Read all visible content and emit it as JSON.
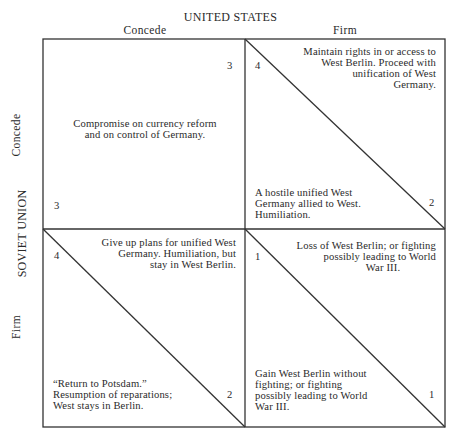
{
  "header": {
    "column_player": "UNITED STATES",
    "column_strategies": [
      "Concede",
      "Firm"
    ]
  },
  "side": {
    "row_player": "SOVIET UNION",
    "row_strategies": [
      "Concede",
      "Firm"
    ]
  },
  "cells": {
    "concede_concede": {
      "text": "Compromise on currency reform and on control of Germany.",
      "lines": [
        "Compromise on currency reform",
        "and on control of Germany."
      ],
      "us_payoff": "3",
      "su_payoff": "3"
    },
    "su_concede_us_firm": {
      "us_lines": [
        "Maintain rights in or access to",
        "West Berlin. Proceed with",
        "unification of West",
        "Germany."
      ],
      "su_lines": [
        "A hostile unified West",
        "Germany allied to West.",
        "Humiliation."
      ],
      "us_payoff": "4",
      "su_payoff": "2"
    },
    "su_firm_us_concede": {
      "us_lines": [
        "Give up plans for unified West",
        "Germany. Humiliation, but",
        "stay in West Berlin."
      ],
      "su_lines": [
        "“Return to Potsdam.”",
        "Resumption of reparations;",
        "West stays in Berlin."
      ],
      "us_payoff": "2",
      "su_payoff": "4"
    },
    "firm_firm": {
      "us_lines": [
        "Loss of West Berlin; or fighting",
        "possibly leading to World",
        "War III."
      ],
      "su_lines": [
        "Gain West Berlin without",
        "fighting; or fighting",
        "possibly leading to World",
        "War III."
      ],
      "us_payoff": "1",
      "su_payoff": "1"
    }
  },
  "colors": {
    "ink": "#2a2a2a",
    "background": "#ffffff"
  }
}
